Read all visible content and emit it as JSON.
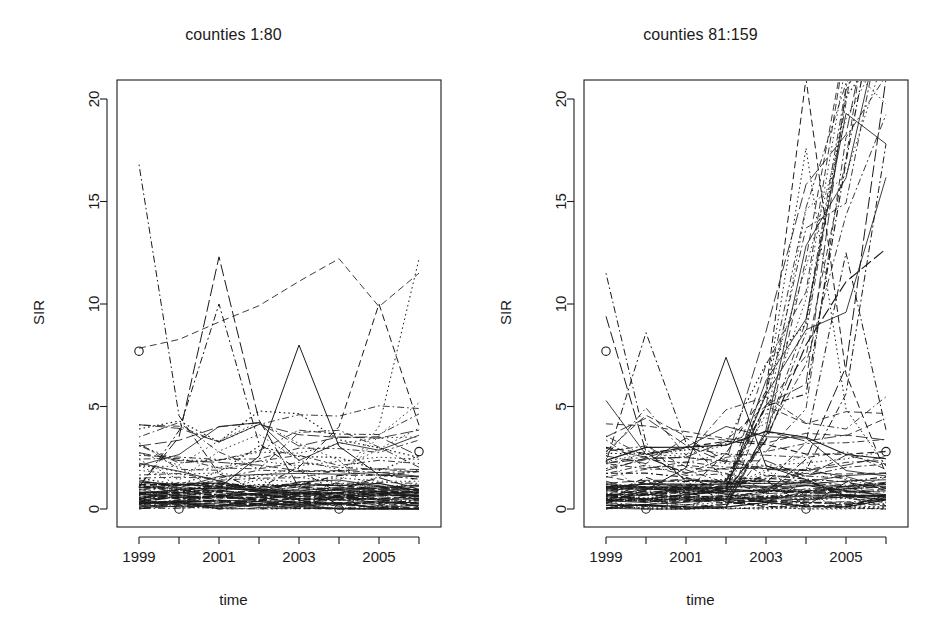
{
  "figure": {
    "width": 934,
    "height": 632,
    "background": "#ffffff",
    "ink": "#1a1a1a",
    "panel_count": 2
  },
  "panels": [
    {
      "id": "left",
      "title": "counties 1:80",
      "xlabel": "time",
      "ylabel": "SIR",
      "series_count": 80,
      "seed": 1080
    },
    {
      "id": "right",
      "title": "counties 81:159",
      "xlabel": "time",
      "ylabel": "SIR",
      "series_count": 79,
      "seed": 81159
    }
  ],
  "chart_data": {
    "type": "line",
    "subtitle": "",
    "xlabel": "time",
    "ylabel": "SIR",
    "grid": false,
    "legend": "none",
    "panels": [
      {
        "title": "counties 1:80",
        "n_series": 80,
        "series_label_range": "counties 1:80",
        "x": [
          1999,
          2000,
          2001,
          2002,
          2003,
          2004,
          2005,
          2006
        ],
        "xtick_values": [
          1999,
          2000,
          2001,
          2002,
          2003,
          2004,
          2005,
          2006
        ],
        "xtick_labels": [
          "1999",
          "",
          "2001",
          "",
          "2003",
          "",
          "2005",
          ""
        ],
        "xlim": [
          1998.78,
          2006.22
        ],
        "ytick_values": [
          0,
          5,
          10,
          15,
          20
        ],
        "ytick_labels": [
          "0",
          "5",
          "10",
          "15",
          "20"
        ],
        "ylim": [
          -0.55,
          21.0
        ],
        "y_data_max_visible": 16.8,
        "y_data_min_visible": 0,
        "notes": "Spaghetti plot of standardized incidence ratios for 80 counties, 1999-2006. Most trajectories stay between 0 and 3; a handful spike to 10-17. Line types cycle solid / dashed / dotted / dash-dot as in R matplot.",
        "highlight_peaks": [
          {
            "x": 1999,
            "y": 16.8
          },
          {
            "x": 2001,
            "y": 12.3
          },
          {
            "x": 2001,
            "y": 10.0
          },
          {
            "x": 2003,
            "y": 8.0
          },
          {
            "x": 2005,
            "y": 10.0
          },
          {
            "x": 2006,
            "y": 12.2
          }
        ]
      },
      {
        "title": "counties 81:159",
        "n_series": 79,
        "series_label_range": "counties 81:159",
        "x": [
          1999,
          2000,
          2001,
          2002,
          2003,
          2004,
          2005,
          2006
        ],
        "xtick_values": [
          1999,
          2000,
          2001,
          2002,
          2003,
          2004,
          2005,
          2006
        ],
        "xtick_labels": [
          "1999",
          "",
          "2001",
          "",
          "2003",
          "",
          "2005",
          ""
        ],
        "xlim": [
          1998.78,
          2006.22
        ],
        "ytick_values": [
          0,
          5,
          10,
          15,
          20
        ],
        "ytick_labels": [
          "0",
          "5",
          "10",
          "15",
          "20"
        ],
        "ylim": [
          -0.55,
          21.0
        ],
        "y_data_max_visible": 21.0,
        "y_data_min_visible": 0,
        "notes": "Spaghetti plot of standardized incidence ratios for 79 counties, 1999-2006. Bulk of lines under 3; several trajectories explode after 2003, with peaks at 2004 reaching and exceeding the top of the axis (>21) and steep rises toward 2006.",
        "highlight_peaks": [
          {
            "x": 1999,
            "y": 11.5
          },
          {
            "x": 1999,
            "y": 9.4
          },
          {
            "x": 2000,
            "y": 8.6
          },
          {
            "x": 2002,
            "y": 7.4
          },
          {
            "x": 2004,
            "y": 21.0
          },
          {
            "x": 2004,
            "y": 17.6
          },
          {
            "x": 2005,
            "y": 12.5
          },
          {
            "x": 2006,
            "y": 21.0
          },
          {
            "x": 2006,
            "y": 17.8
          }
        ]
      }
    ]
  },
  "geometry": {
    "plot_box": {
      "left": 117,
      "right": 441,
      "top": 80,
      "bottom": 527
    },
    "y_pixel_for_0": 509,
    "y_pixel_for_20": 99,
    "x_pixel_for_1999": 139,
    "x_pixel_for_2006": 419
  }
}
